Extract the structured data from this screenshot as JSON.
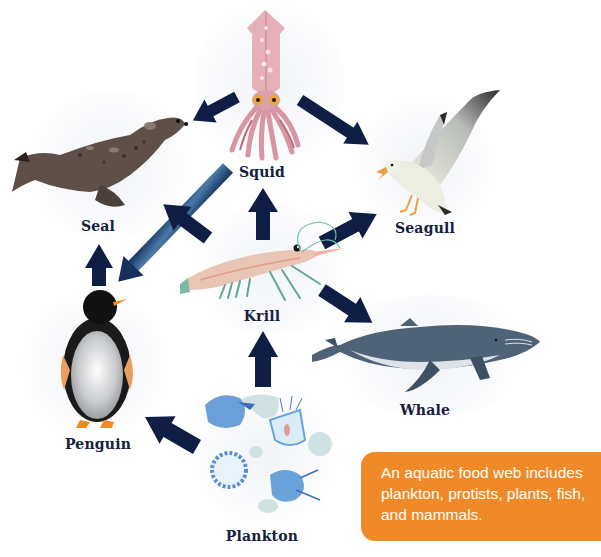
{
  "diagram": {
    "type": "food-web",
    "nodes": [
      {
        "id": "squid",
        "label": "Squid"
      },
      {
        "id": "seal",
        "label": "Seal"
      },
      {
        "id": "seagull",
        "label": "Seagull"
      },
      {
        "id": "krill",
        "label": "Krill"
      },
      {
        "id": "penguin",
        "label": "Penguin"
      },
      {
        "id": "whale",
        "label": "Whale"
      },
      {
        "id": "plankton",
        "label": "Plankton"
      }
    ],
    "edges": [
      {
        "from": "squid",
        "to": "seal"
      },
      {
        "from": "squid",
        "to": "seagull"
      },
      {
        "from": "squid",
        "to": "penguin"
      },
      {
        "from": "krill",
        "to": "squid"
      },
      {
        "from": "krill",
        "to": "seal"
      },
      {
        "from": "krill",
        "to": "seagull"
      },
      {
        "from": "krill",
        "to": "whale"
      },
      {
        "from": "penguin",
        "to": "seal"
      },
      {
        "from": "plankton",
        "to": "krill"
      },
      {
        "from": "plankton",
        "to": "penguin"
      }
    ],
    "caption": "An aquatic food web includes plankton, protists, plants, fish, and mammals."
  },
  "colors": {
    "arrow": "#0f1e45",
    "arrow_gradient_end": "#4a7aa8",
    "label": "#14213d",
    "caption_bg": "#f08a28",
    "caption_text": "#ffffff"
  }
}
